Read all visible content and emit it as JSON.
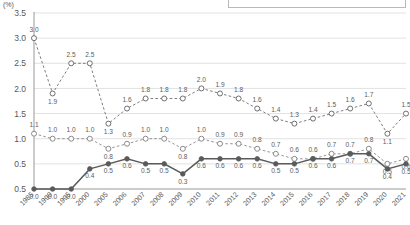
{
  "axis": {
    "unit_label": "(%)",
    "y_ticks": [
      "0.5",
      "0.5",
      "1.0",
      "1.5",
      "2.0",
      "2.5",
      "3.0",
      "3.5"
    ],
    "x_labels": [
      "1985",
      "1990",
      "1995",
      "2000",
      "2005",
      "2006",
      "2007",
      "2008",
      "2009",
      "2010",
      "2011",
      "2012",
      "2013",
      "2014",
      "2015",
      "2016",
      "2017",
      "2018",
      "2019",
      "2020",
      "2021"
    ]
  },
  "legend": {
    "items": []
  },
  "colors": {
    "series_top": "#6e6e6e",
    "series_middle": "#8a8a8a",
    "series_bottom": "#5a5a5a",
    "gridline": "#d6d6d6",
    "axis": "#8d8d8d",
    "label_text": "#5d5d5d"
  },
  "chart_data": {
    "type": "line",
    "title": "",
    "xlabel": "",
    "ylabel": "(%)",
    "ylim": [
      0.0,
      3.5
    ],
    "grid": true,
    "legend_position": "top-right",
    "x": [
      "1985",
      "1990",
      "1995",
      "2000",
      "2005",
      "2006",
      "2007",
      "2008",
      "2009",
      "2010",
      "2011",
      "2012",
      "2013",
      "2014",
      "2015",
      "2016",
      "2017",
      "2018",
      "2019",
      "2020",
      "2021"
    ],
    "categories": [
      "1985",
      "1990",
      "1995",
      "2000",
      "2005",
      "2006",
      "2007",
      "2008",
      "2009",
      "2010",
      "2011",
      "2012",
      "2013",
      "2014",
      "2015",
      "2016",
      "2017",
      "2018",
      "2019",
      "2020",
      "2021"
    ],
    "series": [
      {
        "name": "series-top",
        "style": "dashed",
        "marker": "open-circle",
        "values": [
          3.0,
          1.9,
          2.5,
          2.5,
          1.3,
          1.6,
          1.8,
          1.8,
          1.8,
          2.0,
          1.9,
          1.8,
          1.6,
          1.4,
          1.3,
          1.4,
          1.5,
          1.6,
          1.7,
          1.1,
          1.5
        ],
        "labels": [
          "3.0",
          "1.9",
          "2.5",
          "2.5",
          "1.3",
          "1.6",
          "1.8",
          "1.8",
          "1.8",
          "2.0",
          "1.9",
          "1.8",
          "1.6",
          "1.4",
          "1.3",
          "1.4",
          "1.5",
          "1.6",
          "1.7",
          "1.1",
          "1.5"
        ]
      },
      {
        "name": "series-middle",
        "style": "dashed",
        "marker": "open-circle",
        "values": [
          1.1,
          1.0,
          1.0,
          1.0,
          0.8,
          0.9,
          1.0,
          1.0,
          0.8,
          1.0,
          0.9,
          0.9,
          0.8,
          0.7,
          0.6,
          0.6,
          0.7,
          0.7,
          0.8,
          0.5,
          0.6
        ],
        "labels": [
          "1.1",
          "1.0",
          "1.0",
          "1.0",
          "0.8",
          "0.9",
          "1.0",
          "1.0",
          "0.8",
          "1.0",
          "0.9",
          "0.9",
          "0.8",
          "0.7",
          "0.6",
          "0.6",
          "0.7",
          "0.7",
          "0.8",
          "0.5",
          "0.6"
        ]
      },
      {
        "name": "series-bottom",
        "style": "solid",
        "marker": "filled-circle",
        "values": [
          0.0,
          0.0,
          0.0,
          0.4,
          0.5,
          0.6,
          0.5,
          0.5,
          0.3,
          0.6,
          0.6,
          0.6,
          0.6,
          0.5,
          0.5,
          0.6,
          0.6,
          0.7,
          0.7,
          0.4,
          0.5
        ],
        "labels": [
          "0.0",
          "0.0",
          "0.0",
          "0.4",
          "0.5",
          "0.6",
          "0.5",
          "0.5",
          "0.3",
          "0.6",
          "0.6",
          "0.6",
          "0.6",
          "0.5",
          "0.5",
          "0.6",
          "0.6",
          "0.7",
          "0.7",
          "0.4",
          "0.5"
        ]
      }
    ]
  }
}
